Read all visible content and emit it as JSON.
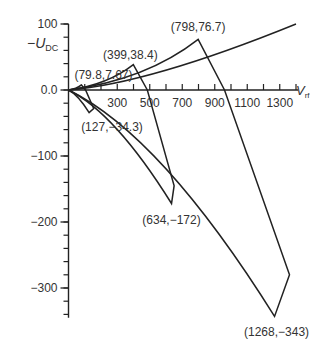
{
  "chart_data": {
    "type": "line",
    "title": "",
    "xlabel": "V_rf",
    "ylabel": "-U_DC",
    "xlim": [
      0,
      1400
    ],
    "ylim": [
      -350,
      100
    ],
    "x_ticks": [
      300,
      500,
      700,
      900,
      1100,
      1300
    ],
    "x_minor_ticks": [
      100,
      200,
      300,
      400,
      500,
      600,
      700,
      800,
      900,
      1000,
      1100,
      1200,
      1300,
      1400
    ],
    "y_ticks": [
      100,
      0,
      -100,
      -200,
      -300
    ],
    "y_tick_labels": [
      "100",
      "0.0",
      "−100",
      "−200",
      "−300"
    ],
    "grid": false,
    "annotations": [
      {
        "label": "(79.8,7.67)",
        "x": 79.8,
        "y": 7.67
      },
      {
        "label": "(127,−34.3)",
        "x": 127,
        "y": -34.3
      },
      {
        "label": "(399,38.4)",
        "x": 399,
        "y": 38.4
      },
      {
        "label": "(634,−172)",
        "x": 634,
        "y": -172
      },
      {
        "label": "(798,76.7)",
        "x": 798,
        "y": 76.7
      },
      {
        "label": "(1268,−343)",
        "x": 1268,
        "y": -343
      }
    ],
    "series": [
      {
        "name": "small loop",
        "points": [
          [
            0,
            0
          ],
          [
            79.8,
            7.67
          ],
          [
            110,
            0
          ],
          [
            160,
            -30
          ],
          [
            127,
            -34.3
          ],
          [
            80,
            -10
          ],
          [
            0,
            0
          ]
        ]
      },
      {
        "name": "middle loop",
        "points": [
          [
            0,
            0
          ],
          [
            399,
            38.4
          ],
          [
            480,
            0
          ],
          [
            640,
            -150
          ],
          [
            634,
            -172
          ],
          [
            300,
            -60
          ],
          [
            0,
            0
          ]
        ]
      },
      {
        "name": "large loop",
        "points": [
          [
            0,
            0
          ],
          [
            798,
            76.7
          ],
          [
            960,
            0
          ],
          [
            1360,
            -280
          ],
          [
            1268,
            -343
          ],
          [
            600,
            -100
          ],
          [
            0,
            0
          ]
        ]
      }
    ]
  },
  "axes": {
    "y_label_main": "−U",
    "y_label_sub": "DC",
    "x_label_main": "V",
    "x_label_sub": "rf"
  }
}
